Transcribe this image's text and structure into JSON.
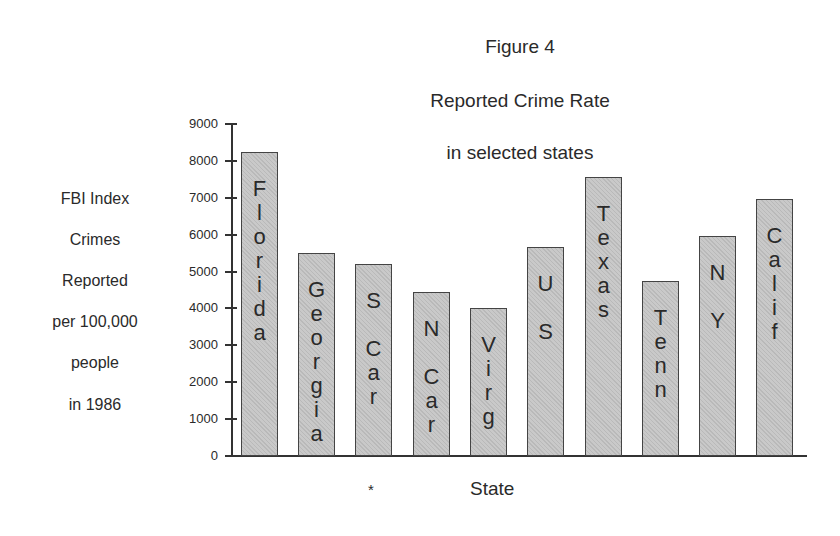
{
  "chart_data": {
    "type": "bar",
    "title": "Figure 4",
    "subtitle": [
      "Reported Crime Rate",
      "in selected states"
    ],
    "xlabel": "State",
    "ylabel": [
      "FBI Index",
      "Crimes",
      "Reported",
      "per 100,000",
      "people",
      "in 1986"
    ],
    "ylim": [
      0,
      9000
    ],
    "yticks": [
      0,
      1000,
      2000,
      3000,
      4000,
      5000,
      6000,
      7000,
      8000,
      9000
    ],
    "grid": false,
    "legend": null,
    "categories": [
      "Florida",
      "Georgia",
      "S Car",
      "N Car",
      "Virg",
      "US",
      "Texas",
      "Tenn",
      "NY",
      "Calif"
    ],
    "values": [
      8200,
      5450,
      5150,
      4400,
      3950,
      5600,
      7500,
      4700,
      5900,
      6900
    ],
    "annotations": [
      "*"
    ]
  },
  "labels": {
    "title": "Figure 4",
    "subtitle1": "Reported Crime Rate",
    "subtitle2": "in selected states",
    "ylabel": [
      "FBI Index",
      "Crimes",
      "Reported",
      "per 100,000",
      "people",
      "in 1986"
    ],
    "xlabel": "State",
    "footnote_marker": "*",
    "ticks": [
      "0",
      "1000",
      "2000",
      "3000",
      "4000",
      "5000",
      "6000",
      "7000",
      "8000",
      "9000"
    ],
    "bars": [
      "F\nl\no\nr\ni\nd\na",
      "G\ne\no\nr\ng\ni\na",
      "S\n\nC\na\nr",
      "N\n\nC\na\nr",
      "V\ni\nr\ng",
      "U\n\nS",
      "T\ne\nx\na\ns",
      "T\ne\nn\nn",
      "N\n\nY",
      "C\na\nl\ni\nf"
    ]
  }
}
